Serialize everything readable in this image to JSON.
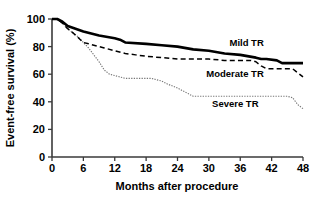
{
  "chart_data": {
    "type": "line",
    "title": "",
    "subtitle": "",
    "xlabel": "Months after procedure",
    "ylabel": "Event-free survival (%)",
    "xlim": [
      0,
      48
    ],
    "ylim": [
      0,
      100
    ],
    "xticks": [
      0,
      6,
      12,
      18,
      24,
      30,
      36,
      42,
      48
    ],
    "xtick_labels": [
      "0",
      "6",
      "12",
      "18",
      "24",
      "30",
      "36",
      "42",
      "48"
    ],
    "yticks": [
      0,
      20,
      40,
      60,
      80,
      100
    ],
    "ytick_labels": [
      "0",
      "20",
      "40",
      "60",
      "80",
      "100"
    ],
    "grid": false,
    "legend_position": "inline-annotations",
    "series": [
      {
        "name": "Mild TR",
        "label": "Mild TR",
        "style": "solid-thick",
        "color": "#000000",
        "x": [
          0,
          1,
          2,
          3,
          6,
          9,
          12,
          13,
          14,
          18,
          21,
          24,
          27,
          30,
          33,
          36,
          39,
          40,
          41,
          43,
          44,
          48
        ],
        "y": [
          100,
          100,
          98,
          95,
          91,
          88,
          86,
          85,
          83,
          82,
          81,
          80,
          78,
          77,
          75,
          74,
          72,
          71,
          71,
          70,
          68,
          68
        ]
      },
      {
        "name": "Moderate TR",
        "label": "Moderate TR",
        "style": "dashed",
        "color": "#000000",
        "x": [
          0,
          1,
          2,
          3,
          4,
          6,
          7,
          8,
          9,
          10,
          12,
          14,
          16,
          18,
          21,
          24,
          27,
          30,
          33,
          36,
          38,
          39,
          40,
          41,
          44,
          46,
          47,
          48
        ],
        "y": [
          100,
          100,
          97,
          93,
          90,
          83,
          82,
          81,
          80,
          79,
          77,
          75,
          74,
          73,
          72,
          71,
          71,
          71,
          70,
          70,
          70,
          69,
          66,
          64,
          64,
          64,
          61,
          58
        ]
      },
      {
        "name": "Severe TR",
        "label": "Severe TR",
        "style": "dotted",
        "color": "#777777",
        "x": [
          0,
          1,
          2,
          3,
          5,
          6,
          7,
          8,
          9,
          10,
          11,
          12,
          13,
          14,
          16,
          18,
          19,
          20,
          21,
          22,
          24,
          26,
          27,
          30,
          34,
          38,
          42,
          45,
          46,
          47,
          48
        ],
        "y": [
          100,
          100,
          97,
          93,
          87,
          83,
          79,
          74,
          69,
          63,
          60,
          59,
          58,
          57,
          57,
          57,
          57,
          56,
          55,
          53,
          50,
          46,
          44,
          44,
          44,
          44,
          44,
          44,
          43,
          38,
          35
        ]
      }
    ],
    "annotations": [
      {
        "text": "Mild TR",
        "x": 40.5,
        "y": 80.5
      },
      {
        "text": "Moderate TR",
        "x": 40.5,
        "y": 58.0
      },
      {
        "text": "Severe TR",
        "x": 39.5,
        "y": 36.0
      }
    ]
  }
}
